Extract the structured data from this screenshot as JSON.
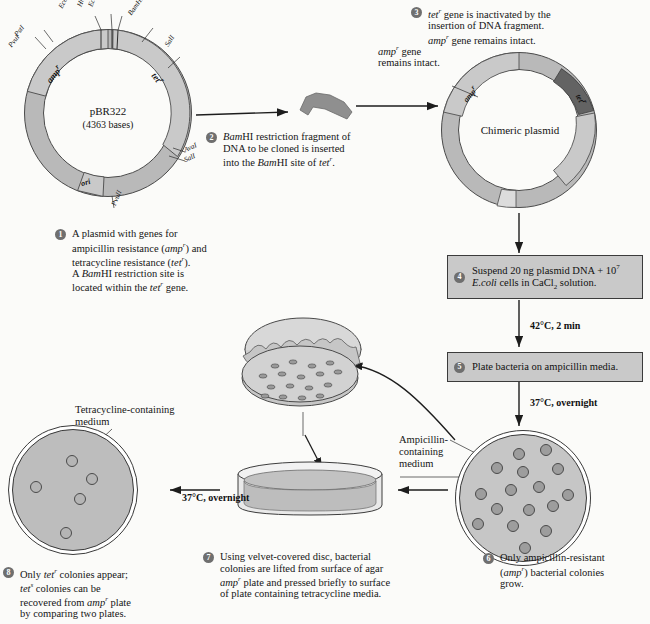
{
  "figure": {
    "title": "Molecular cloning with pBR322 and replica plating",
    "ink": "#151515",
    "plasmid_fill": "#b9b9b9",
    "plasmid_stroke": "#4a4a4a",
    "insert_fill": "#6e6e6e",
    "box_fill": "#c9c9c9",
    "colony_fill": "#9d9d9d",
    "agar_fill": "#bdbdbd"
  },
  "plasmid1": {
    "name": "pBR322",
    "bases": "(4363 bases)",
    "genes": [
      {
        "id": "amp",
        "label": "amp",
        "sup": "r"
      },
      {
        "id": "tet",
        "label": "tet",
        "sup": "r"
      },
      {
        "id": "ori",
        "label": "ori",
        "sup": ""
      }
    ],
    "sites": [
      {
        "name": "PstI",
        "pos": "upper-left"
      },
      {
        "name": "PvuI",
        "pos": "upper-left"
      },
      {
        "name": "EcoRI",
        "pos": "top"
      },
      {
        "name": "HindIII",
        "pos": "top"
      },
      {
        "name": "EcoRV",
        "pos": "top"
      },
      {
        "name": "BamHI",
        "pos": "top-right"
      },
      {
        "name": "SalI",
        "pos": "right"
      },
      {
        "name": "AvaI",
        "pos": "lower-right"
      },
      {
        "name": "SalI",
        "pos": "lower-right"
      },
      {
        "name": "PvuII",
        "pos": "bottom"
      }
    ]
  },
  "plasmid2": {
    "name": "Chimeric plasmid",
    "genes": [
      {
        "id": "amp",
        "label": "amp",
        "sup": "r"
      },
      {
        "id": "tet",
        "label": "tet",
        "sup": "r"
      }
    ]
  },
  "annotations": {
    "amp_intact_line1": "amp",
    "amp_intact_sup": "r",
    "amp_intact_line1b": " gene",
    "amp_intact_line2": "remains intact.",
    "tetracycline_medium_line1": "Tetracycline-containing",
    "tetracycline_medium_line2": "medium",
    "ampicillin_medium_line1": "Ampicillin-",
    "ampicillin_medium_line2": "containing",
    "ampicillin_medium_line3": "medium"
  },
  "steps": [
    {
      "number": "1",
      "kind": "caption",
      "lines": [
        {
          "runs": [
            {
              "t": "A plasmid with genes for",
              "s": "n"
            }
          ]
        },
        {
          "runs": [
            {
              "t": "ampicillin resistance (",
              "s": "n"
            },
            {
              "t": "amp",
              "s": "i"
            },
            {
              "t": "r",
              "s": "sup"
            },
            {
              "t": ") and",
              "s": "n"
            }
          ]
        },
        {
          "runs": [
            {
              "t": "tetracycline resistance (",
              "s": "n"
            },
            {
              "t": "tet",
              "s": "i"
            },
            {
              "t": "r",
              "s": "sup"
            },
            {
              "t": ").",
              "s": "n"
            }
          ]
        },
        {
          "runs": [
            {
              "t": "A ",
              "s": "n"
            },
            {
              "t": "Bam",
              "s": "i"
            },
            {
              "t": "HI restriction site is",
              "s": "n"
            }
          ]
        },
        {
          "runs": [
            {
              "t": "located within the ",
              "s": "n"
            },
            {
              "t": "tet",
              "s": "i"
            },
            {
              "t": "r",
              "s": "sup"
            },
            {
              "t": " gene.",
              "s": "n"
            }
          ]
        }
      ]
    },
    {
      "number": "2",
      "kind": "caption",
      "lines": [
        {
          "runs": [
            {
              "t": "Bam",
              "s": "i"
            },
            {
              "t": "HI restriction fragment of",
              "s": "n"
            }
          ]
        },
        {
          "runs": [
            {
              "t": "DNA to be cloned is inserted",
              "s": "n"
            }
          ]
        },
        {
          "runs": [
            {
              "t": "into the ",
              "s": "n"
            },
            {
              "t": "Bam",
              "s": "i"
            },
            {
              "t": "HI site of ",
              "s": "n"
            },
            {
              "t": "tet",
              "s": "i"
            },
            {
              "t": "r",
              "s": "sup"
            },
            {
              "t": ".",
              "s": "n"
            }
          ]
        }
      ]
    },
    {
      "number": "3",
      "kind": "caption",
      "lines": [
        {
          "runs": [
            {
              "t": "tet",
              "s": "i"
            },
            {
              "t": "r",
              "s": "sup"
            },
            {
              "t": " gene is inactivated by the",
              "s": "n"
            }
          ]
        },
        {
          "runs": [
            {
              "t": "insertion of DNA fragment.",
              "s": "n"
            }
          ]
        },
        {
          "runs": [
            {
              "t": "amp",
              "s": "i"
            },
            {
              "t": "r",
              "s": "sup"
            },
            {
              "t": " gene remains intact.",
              "s": "n"
            }
          ]
        }
      ]
    },
    {
      "number": "4",
      "kind": "box",
      "lines": [
        {
          "runs": [
            {
              "t": "Suspend 20 ng plasmid DNA + 10",
              "s": "n"
            },
            {
              "t": "7",
              "s": "sup2"
            }
          ]
        },
        {
          "runs": [
            {
              "t": "E.coli",
              "s": "i"
            },
            {
              "t": " cells in CaCl",
              "s": "n"
            },
            {
              "t": "2",
              "s": "sub"
            },
            {
              "t": " solution.",
              "s": "n"
            }
          ]
        }
      ]
    },
    {
      "number": "5",
      "kind": "box",
      "lines": [
        {
          "runs": [
            {
              "t": "Plate bacteria on ampicillin media.",
              "s": "n"
            }
          ]
        }
      ]
    },
    {
      "number": "6",
      "kind": "caption",
      "lines": [
        {
          "runs": [
            {
              "t": "Only ampicillin-resistant",
              "s": "n"
            }
          ]
        },
        {
          "runs": [
            {
              "t": "(",
              "s": "n"
            },
            {
              "t": "amp",
              "s": "i"
            },
            {
              "t": "r",
              "s": "sup"
            },
            {
              "t": ") bacterial colonies",
              "s": "n"
            }
          ]
        },
        {
          "runs": [
            {
              "t": "grow.",
              "s": "n"
            }
          ]
        }
      ]
    },
    {
      "number": "7",
      "kind": "caption",
      "lines": [
        {
          "runs": [
            {
              "t": "Using velvet-covered disc, bacterial",
              "s": "n"
            }
          ]
        },
        {
          "runs": [
            {
              "t": "colonies are lifted from surface of agar",
              "s": "n"
            }
          ]
        },
        {
          "runs": [
            {
              "t": "amp",
              "s": "i"
            },
            {
              "t": "r",
              "s": "sup"
            },
            {
              "t": " plate and pressed briefly to surface",
              "s": "n"
            }
          ]
        },
        {
          "runs": [
            {
              "t": "of plate containing tetracycline media.",
              "s": "n"
            }
          ]
        }
      ]
    },
    {
      "number": "8",
      "kind": "caption",
      "lines": [
        {
          "runs": [
            {
              "t": "Only ",
              "s": "n"
            },
            {
              "t": "tet",
              "s": "i"
            },
            {
              "t": "r",
              "s": "sup"
            },
            {
              "t": " colonies appear;",
              "s": "n"
            }
          ]
        },
        {
          "runs": [
            {
              "t": "tet",
              "s": "i"
            },
            {
              "t": "s",
              "s": "sup"
            },
            {
              "t": " colonies can be",
              "s": "n"
            }
          ]
        },
        {
          "runs": [
            {
              "t": "recovered from ",
              "s": "n"
            },
            {
              "t": "amp",
              "s": "i"
            },
            {
              "t": "r",
              "s": "sup"
            },
            {
              "t": " plate",
              "s": "n"
            }
          ]
        },
        {
          "runs": [
            {
              "t": "by comparing two plates.",
              "s": "n"
            }
          ]
        }
      ]
    }
  ],
  "conditions": [
    {
      "id": "heat-shock",
      "text": "42°C, 2 min"
    },
    {
      "id": "incubate-amp",
      "text": "37°C, overnight"
    },
    {
      "id": "incubate-tet",
      "text": "37°C, overnight"
    }
  ],
  "plates": {
    "ampicillin": {
      "colony_count": 16,
      "colonies": [
        {
          "x": 62,
          "y": 22
        },
        {
          "x": 85,
          "y": 18
        },
        {
          "x": 40,
          "y": 34
        },
        {
          "x": 63,
          "y": 37
        },
        {
          "x": 95,
          "y": 34
        },
        {
          "x": 26,
          "y": 58
        },
        {
          "x": 53,
          "y": 55
        },
        {
          "x": 79,
          "y": 52
        },
        {
          "x": 104,
          "y": 59
        },
        {
          "x": 40,
          "y": 72
        },
        {
          "x": 68,
          "y": 73
        },
        {
          "x": 91,
          "y": 70
        },
        {
          "x": 22,
          "y": 88
        },
        {
          "x": 54,
          "y": 90
        },
        {
          "x": 84,
          "y": 94
        },
        {
          "x": 66,
          "y": 110
        }
      ]
    },
    "tetracycline": {
      "colony_count": 5,
      "colonies": [
        {
          "x": 62,
          "y": 32
        },
        {
          "x": 24,
          "y": 58
        },
        {
          "x": 83,
          "y": 50
        },
        {
          "x": 70,
          "y": 70
        },
        {
          "x": 55,
          "y": 105
        }
      ]
    },
    "velvet_disc": {
      "colony_count": 17
    }
  }
}
